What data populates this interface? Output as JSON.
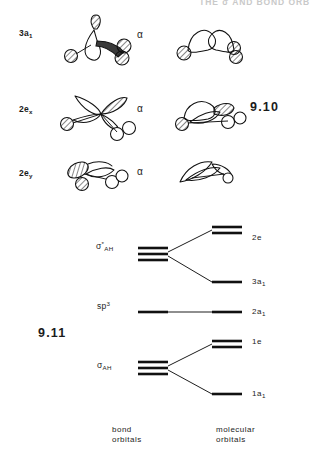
{
  "header": {
    "text": "THE  σ   AND   BOND  ORB"
  },
  "figure_910": {
    "number": "9.10",
    "rows": [
      {
        "label_main": "3a",
        "label_sub": "1",
        "relation": "α"
      },
      {
        "label_main": "2e",
        "label_sub": "x",
        "relation": "α"
      },
      {
        "label_main": "2e",
        "label_sub": "y",
        "relation": "α"
      }
    ]
  },
  "figure_911": {
    "number": "9.11",
    "left_axis_caption": "bond\norbitals",
    "right_axis_caption": "molecular\norbitals",
    "bond_orbitals": [
      {
        "main": "σ",
        "sup": "*",
        "sub": "AH"
      },
      {
        "main": "sp",
        "sup": "3",
        "sub": ""
      },
      {
        "main": "σ",
        "sup": "",
        "sub": "AH"
      }
    ],
    "molecular_orbitals": [
      {
        "main": "2e",
        "sub": ""
      },
      {
        "main": "3a",
        "sub": "1"
      },
      {
        "main": "2a",
        "sub": "1"
      },
      {
        "main": "1e",
        "sub": ""
      },
      {
        "main": "1a",
        "sub": "1"
      }
    ]
  },
  "colors": {
    "ink": "#111111",
    "paper": "#ffffff",
    "header_gray": "#c9c9c9"
  }
}
